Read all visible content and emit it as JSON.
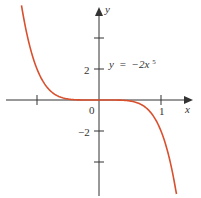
{
  "chart_data": {
    "type": "line",
    "title": "",
    "equation_label": "y = −2x⁵",
    "equation_parts": {
      "lhs": "y",
      "eq": "=",
      "rhs": "−2x",
      "exp": "5"
    },
    "xlabel": "x",
    "ylabel": "y",
    "x_ticks": [
      -1,
      0,
      1
    ],
    "x_tick_labels": [
      "",
      "0",
      "1"
    ],
    "y_ticks": [
      -4,
      -2,
      2,
      4
    ],
    "y_tick_labels": [
      "",
      "−2",
      "2",
      ""
    ],
    "xlim": [
      -1.3,
      1.3
    ],
    "ylim": [
      -6.2,
      6.3
    ],
    "grid": false,
    "legend": "none",
    "series": [
      {
        "name": "y = -2x^5",
        "color": "#d9502e",
        "x": [
          -1.25,
          -1.2,
          -1.1,
          -1.0,
          -0.9,
          -0.8,
          -0.7,
          -0.6,
          -0.5,
          -0.4,
          -0.2,
          0,
          0.2,
          0.4,
          0.5,
          0.6,
          0.7,
          0.8,
          0.9,
          1.0,
          1.1,
          1.2,
          1.25
        ],
        "y": [
          6.1,
          4.98,
          3.22,
          2.0,
          1.18,
          0.66,
          0.34,
          0.16,
          0.06,
          0.02,
          0.0,
          0,
          0.0,
          -0.02,
          -0.06,
          -0.16,
          -0.34,
          -0.66,
          -1.18,
          -2.0,
          -3.22,
          -4.98,
          -6.1
        ]
      }
    ],
    "colors": {
      "curve": "#d9502e",
      "axes": "#333333"
    }
  }
}
